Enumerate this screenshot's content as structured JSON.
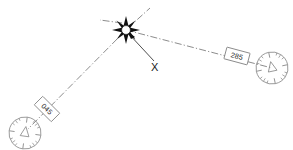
{
  "diagram": {
    "background_color": "#ffffff",
    "line_color": "#6e6e6e",
    "symbol_color": "#111111",
    "rose_color": "#8a8a8a",
    "fix": {
      "symbol_name": "eight-point-star-fix",
      "label": "X",
      "x": 126,
      "y": 30,
      "leader_end_x": 155,
      "leader_end_y": 64
    },
    "radials": [
      {
        "id": "radial-045",
        "label": "045",
        "from_x": 126,
        "from_y": 30,
        "to_x": 28,
        "to_y": 129,
        "label_x": 47,
        "label_y": 109,
        "label_rotation": 45
      },
      {
        "id": "radial-285",
        "label": "285",
        "from_x": 126,
        "from_y": 30,
        "to_x": 272,
        "to_y": 68,
        "label_x": 237,
        "label_y": 56,
        "label_rotation": 15
      }
    ],
    "extensions": [
      {
        "id": "extension-upper-right",
        "x1": 128,
        "y1": 28,
        "x2": 150,
        "y2": 8
      },
      {
        "id": "extension-left",
        "x1": 122,
        "y1": 23,
        "x2": 100,
        "y2": 20
      }
    ],
    "compass_roses": [
      {
        "id": "compass-rose-lower-left",
        "cx": 25,
        "cy": 133,
        "r": 16,
        "rotation": 8,
        "arrow_name": "north-arrow-triangle"
      },
      {
        "id": "compass-rose-right",
        "cx": 272,
        "cy": 68,
        "r": 16,
        "rotation": -12,
        "arrow_name": "north-arrow-triangle"
      }
    ]
  }
}
